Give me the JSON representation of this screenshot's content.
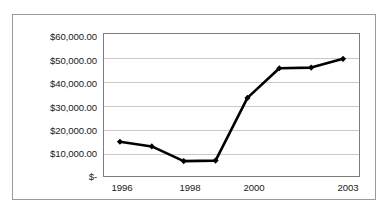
{
  "chart_data": {
    "type": "line",
    "title": "",
    "subtitle": "",
    "xlabel": "",
    "ylabel": "",
    "x": [
      1996,
      1997,
      1998,
      1999,
      2000,
      2001,
      2002,
      2003
    ],
    "values": [
      14500,
      12500,
      6300,
      6500,
      33000,
      45500,
      45800,
      49500
    ],
    "series": [
      {
        "name": "",
        "values": [
          14500,
          12500,
          6300,
          6500,
          33000,
          45500,
          45800,
          49500
        ]
      }
    ],
    "ylim": [
      0,
      60000
    ],
    "xlim": [
      1996,
      2003
    ],
    "ytick_values": [
      0,
      10000,
      20000,
      30000,
      40000,
      50000,
      60000
    ],
    "ytick_labels": [
      "$-",
      "$10,000.00",
      "$20,000.00",
      "$30,000.00",
      "$40,000.00",
      "$50,000.00",
      "$60,000.00"
    ],
    "xtick_values": [
      1996,
      1998,
      2000,
      2003
    ],
    "xtick_labels": [
      "1996",
      "1998",
      "2000",
      "2003"
    ],
    "grid": "horizontal",
    "legend": "none",
    "marker": "diamond",
    "line_color": "#000000",
    "marker_color": "#000000",
    "gridline_color": "#c8c8c8",
    "plot_border_color": "#7d7d7d",
    "outer_border_color": "#9a9a9a",
    "background_color": "#ffffff"
  }
}
